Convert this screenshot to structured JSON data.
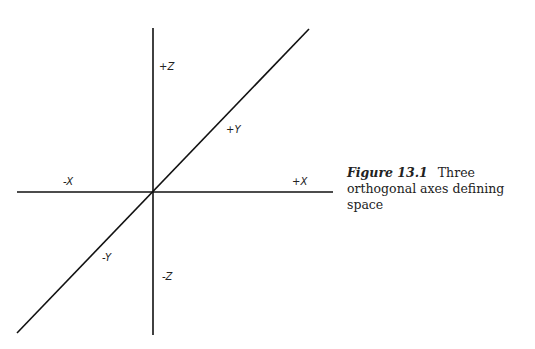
{
  "diagram": {
    "type": "3d-axes",
    "axes": {
      "vertical": {
        "x1": 153,
        "y1": 28,
        "x2": 153,
        "y2": 335
      },
      "horizontal": {
        "x1": 17,
        "y1": 192,
        "x2": 333,
        "y2": 192
      },
      "diagonal": {
        "x1": 17,
        "y1": 333,
        "x2": 309,
        "y2": 29
      }
    },
    "labels": {
      "pos_z": "+Z",
      "pos_y": "+Y",
      "neg_x": "-X",
      "pos_x": "+X",
      "neg_y": "-Y",
      "neg_z": "-Z"
    },
    "line_color": "#111111"
  },
  "caption": {
    "figure_number": "Figure 13.1",
    "text": "Three orthogonal axes defining space"
  }
}
